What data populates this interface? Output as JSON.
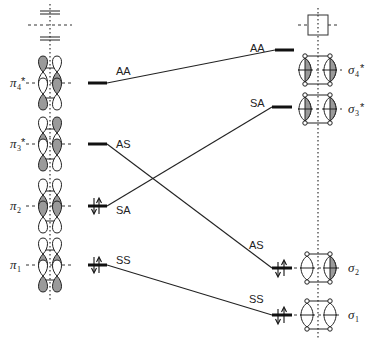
{
  "diagram": {
    "type": "orbital correlation diagram",
    "left_column": {
      "axis_marks": [
        "double-bar",
        "dashed-plane",
        "double-bar"
      ],
      "orbitals": [
        {
          "name": "π4*",
          "symbol": "π",
          "sub": "4",
          "star": "*",
          "symmetry": "AA",
          "occupied": false
        },
        {
          "name": "π3*",
          "symbol": "π",
          "sub": "3",
          "star": "*",
          "symmetry": "AS",
          "occupied": false
        },
        {
          "name": "π2",
          "symbol": "π",
          "sub": "2",
          "star": "",
          "symmetry": "SA",
          "occupied": true
        },
        {
          "name": "π1",
          "symbol": "π",
          "sub": "1",
          "star": "",
          "symmetry": "SS",
          "occupied": true
        }
      ]
    },
    "right_column": {
      "top_mark": "square-box",
      "orbitals": [
        {
          "name": "σ4*",
          "symbol": "σ",
          "sub": "4",
          "star": "*",
          "symmetry": "AA",
          "occupied": false
        },
        {
          "name": "σ3*",
          "symbol": "σ",
          "sub": "3",
          "star": "*",
          "symmetry": "SA",
          "occupied": false
        },
        {
          "name": "σ2",
          "symbol": "σ",
          "sub": "2",
          "star": "",
          "symmetry": "AS",
          "occupied": true
        },
        {
          "name": "σ1",
          "symbol": "σ",
          "sub": "1",
          "star": "",
          "symmetry": "SS",
          "occupied": true
        }
      ]
    },
    "correlations": [
      {
        "from": "π4*",
        "to": "σ4*",
        "label": "AA"
      },
      {
        "from": "π3*",
        "to": "σ2",
        "label": "AS"
      },
      {
        "from": "π2",
        "to": "σ3*",
        "label": "SA"
      },
      {
        "from": "π1",
        "to": "σ1",
        "label": "SS"
      }
    ],
    "labels": {
      "left_AA": "AA",
      "left_AS": "AS",
      "left_SA": "SA",
      "left_SS": "SS",
      "right_AA": "AA",
      "right_SA": "SA",
      "right_AS": "AS",
      "right_SS": "SS",
      "pi4": "π",
      "pi4_sub": "4",
      "pi4_star": "*",
      "pi3": "π",
      "pi3_sub": "3",
      "pi3_star": "*",
      "pi2": "π",
      "pi2_sub": "2",
      "pi1": "π",
      "pi1_sub": "1",
      "sigma4": "σ",
      "sigma4_sub": "4",
      "sigma4_star": "*",
      "sigma3": "σ",
      "sigma3_sub": "3",
      "sigma3_star": "*",
      "sigma2": "σ",
      "sigma2_sub": "2",
      "sigma1": "σ",
      "sigma1_sub": "1"
    }
  }
}
